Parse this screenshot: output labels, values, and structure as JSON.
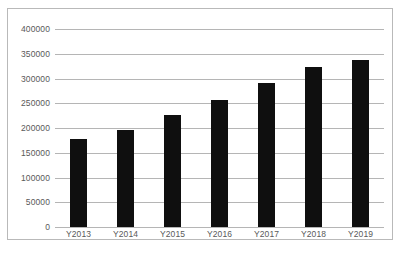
{
  "chart_data": {
    "type": "bar",
    "title": "",
    "subtitle": "",
    "xlabel": "",
    "ylabel": "",
    "categories": [
      "Y2013",
      "Y2014",
      "Y2015",
      "Y2016",
      "Y2017",
      "Y2018",
      "Y2019"
    ],
    "values": [
      177000,
      196000,
      226000,
      256000,
      291000,
      323000,
      337000
    ],
    "series": [
      {
        "name": "",
        "values": [
          177000,
          196000,
          226000,
          256000,
          291000,
          323000,
          337000
        ],
        "color": "#0f0f0f"
      }
    ],
    "ylim": [
      0,
      400000
    ],
    "ytick_values": [
      0,
      50000,
      100000,
      150000,
      200000,
      250000,
      300000,
      350000,
      400000
    ],
    "ytick_labels": [
      "0",
      "50000",
      "100000",
      "150000",
      "200000",
      "250000",
      "300000",
      "350000",
      "400000"
    ],
    "grid": true,
    "grid_axis": "y",
    "legend": false,
    "legend_position": "none",
    "annotations": []
  },
  "style": {
    "bar_color": "#0f0f0f",
    "gridline_color": "#b5b5b5",
    "frame_color": "#b9b9b9",
    "tick_label_color": "#595959",
    "background_color": "#ffffff"
  },
  "caption": {
    "text": ""
  }
}
